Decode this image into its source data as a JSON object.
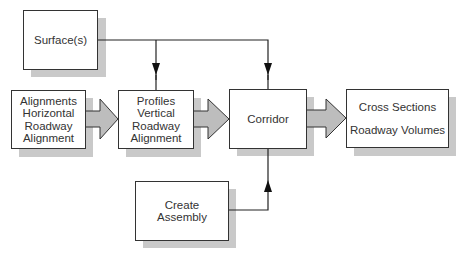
{
  "diagram": {
    "type": "flowchart",
    "nodes": {
      "surfaces": {
        "lines": [
          "Surface(s)"
        ]
      },
      "alignments": {
        "lines": [
          "Alignments",
          "Horizontal",
          "Roadway",
          "Alignment"
        ]
      },
      "profiles": {
        "lines": [
          "Profiles",
          "Vertical",
          "Roadway",
          "Alignment"
        ]
      },
      "corridor": {
        "lines": [
          "Corridor"
        ]
      },
      "outputs": {
        "lines": [
          "Cross Sections",
          "Roadway Volumes"
        ]
      },
      "assembly": {
        "lines": [
          "Create",
          "Assembly"
        ]
      }
    },
    "edges": [
      {
        "from": "surfaces",
        "to": "profiles",
        "style": "line-arrow"
      },
      {
        "from": "surfaces",
        "to": "corridor",
        "style": "line-arrow"
      },
      {
        "from": "alignments",
        "to": "profiles",
        "style": "block-arrow"
      },
      {
        "from": "profiles",
        "to": "corridor",
        "style": "block-arrow"
      },
      {
        "from": "corridor",
        "to": "outputs",
        "style": "block-arrow"
      },
      {
        "from": "assembly",
        "to": "corridor",
        "style": "line-arrow"
      }
    ],
    "colors": {
      "border": "#333333",
      "shadow": "#c9c9c9",
      "block_arrow_fill": "#bdbdbd"
    }
  }
}
